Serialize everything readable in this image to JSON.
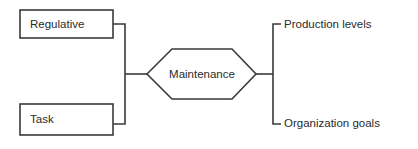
{
  "diagram": {
    "type": "flow-diagram",
    "background_color": "#ffffff",
    "line_color": "#3a3a3a",
    "text_color": "#2b2b2b",
    "inputs": [
      {
        "id": "regulative",
        "label": "Regulative",
        "shape": "rectangle",
        "x": 20,
        "y": 10,
        "width": 93,
        "height": 28,
        "label_x": 30,
        "label_y": 24.5
      },
      {
        "id": "task",
        "label": "Task",
        "shape": "rectangle",
        "x": 20,
        "y": 104,
        "width": 93,
        "height": 31,
        "label_x": 30,
        "label_y": 120
      }
    ],
    "process": {
      "id": "maintenance",
      "label": "Maintenance",
      "shape": "hexagon",
      "points": "147,74 172,49 232,49 256,74 232,99 172,99",
      "label_x": 202,
      "label_y": 74.5
    },
    "outputs": [
      {
        "id": "production-levels",
        "label": "Production levels",
        "label_x": 284,
        "label_y": 24.5,
        "tick_y": 24
      },
      {
        "id": "organization-goals",
        "label": "Organization goals",
        "label_x": 284,
        "label_y": 124,
        "tick_y": 124
      }
    ],
    "connectors": {
      "input_bus": "M113,24 L125,24 L125,124 L113,124",
      "input_to_process": "M125,74 L147,74",
      "process_to_output_bus": "M256,74 L273,74",
      "output_bus": "M281,24 L273,24 L273,124 L281,124"
    }
  }
}
